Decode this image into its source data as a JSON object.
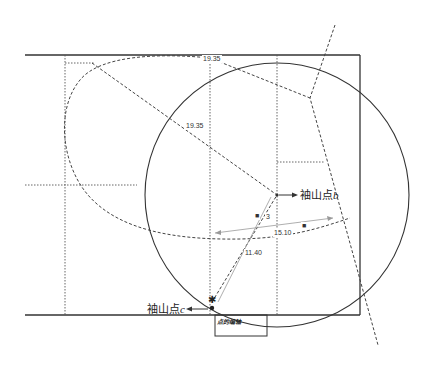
{
  "diagram": {
    "type": "geometric construction (foul-line / sideline layout with large circle)",
    "dimensions": {
      "top_distance": "19.35",
      "diagonal_distance": "19.35",
      "arc_distance": "15.10",
      "radius_short": "11.40",
      "offset_label": "3"
    },
    "points": {
      "b": {
        "label": "袖山点",
        "suffix": "b"
      },
      "c": {
        "label": "袖山点",
        "suffix": "c"
      }
    },
    "markers": {
      "square_1": "■",
      "square_2": "■",
      "star": "✱"
    },
    "box_label": "点的编轴",
    "colors": {
      "line": "#333333",
      "guide": "#555555",
      "arrow": "#888888",
      "background": "#ffffff"
    }
  }
}
